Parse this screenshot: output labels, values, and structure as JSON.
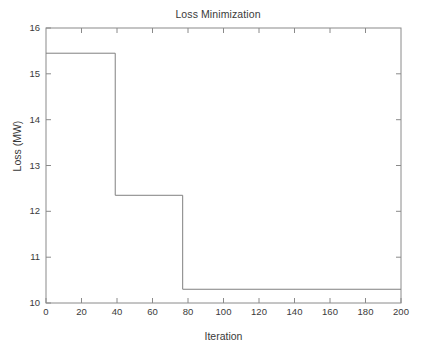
{
  "chart_data": {
    "type": "line",
    "title": "Loss Minimization",
    "xlabel": "Iteration",
    "ylabel": "Loss (MW)",
    "xlim": [
      0,
      200
    ],
    "ylim": [
      10,
      16
    ],
    "xticks": [
      0,
      20,
      40,
      60,
      80,
      100,
      120,
      140,
      160,
      180,
      200
    ],
    "yticks": [
      10,
      11,
      12,
      13,
      14,
      15,
      16
    ],
    "grid": false,
    "legend": null,
    "line_color": "#808080",
    "drawstyle": "steps-post",
    "series": [
      {
        "name": "Loss",
        "x": [
          0,
          39,
          39,
          77,
          77,
          200
        ],
        "y": [
          15.45,
          15.45,
          12.35,
          12.35,
          10.3,
          10.3
        ]
      }
    ],
    "steps": [
      {
        "x_start": 0,
        "x_end": 39,
        "value": 15.45
      },
      {
        "x_start": 39,
        "x_end": 77,
        "value": 12.35
      },
      {
        "x_start": 77,
        "x_end": 200,
        "value": 10.3
      }
    ]
  },
  "axes": {
    "title": "Loss Minimization",
    "x_label": "Iteration",
    "y_label": "Loss (MW)",
    "x_tick_labels": [
      "0",
      "20",
      "40",
      "60",
      "80",
      "100",
      "120",
      "140",
      "160",
      "180",
      "200"
    ],
    "y_tick_labels": [
      "10",
      "11",
      "12",
      "13",
      "14",
      "15",
      "16"
    ]
  },
  "colors": {
    "axis": "#8a8a8a",
    "line": "#8a8a8a",
    "text": "#3a3a3a",
    "background": "#ffffff"
  }
}
